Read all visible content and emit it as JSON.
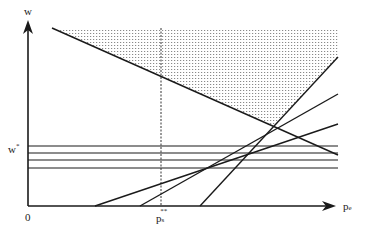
{
  "diagram": {
    "y_axis_label": "w",
    "x_axis_label": "p",
    "x_axis_label_sub": "e",
    "origin_label": "0",
    "w_star_label": "w",
    "w_star_sup": "*",
    "p_marker_label": "p",
    "p_marker_sub": "s",
    "p_marker_sup": "**",
    "colors": {
      "line": "#1a1a1a",
      "shade_dot": "#9a9a9a",
      "background": "#ffffff"
    },
    "lines": [
      {
        "name": "descending-line",
        "from": [
          52,
          28
        ],
        "to": [
          338,
          155
        ]
      },
      {
        "name": "rising-line-shallow",
        "from": [
          95,
          206
        ],
        "to": [
          338,
          124
        ]
      },
      {
        "name": "rising-line-mid",
        "from": [
          140,
          206
        ],
        "to": [
          338,
          94
        ]
      },
      {
        "name": "rising-line-steep",
        "from": [
          200,
          206
        ],
        "to": [
          338,
          57
        ]
      }
    ],
    "horizontal_lines_y": [
      146,
      153,
      160,
      168
    ],
    "dashed_vertical_x": 161,
    "shaded_region": [
      [
        52,
        28
      ],
      [
        338,
        28
      ],
      [
        338,
        57
      ],
      [
        274,
        126
      ]
    ]
  }
}
